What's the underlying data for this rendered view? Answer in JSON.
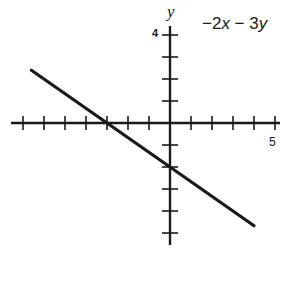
{
  "chart_data": {
    "type": "line",
    "title": "",
    "equation_label": "−2x − 3y",
    "xlabel": "",
    "ylabel": "y",
    "x_tick_label": "5",
    "y_tick_label": "4",
    "xlim": [
      -7,
      5
    ],
    "ylim": [
      -5,
      4
    ],
    "grid": false,
    "x_ticks": [
      -7,
      -6,
      -5,
      -4,
      -3,
      -2,
      -1,
      1,
      2,
      3,
      4,
      5
    ],
    "y_ticks": [
      -5,
      -4,
      -3,
      -2,
      -1,
      1,
      2,
      3,
      4
    ],
    "series": [
      {
        "name": "-2x - 3y = 6",
        "slope": -0.6667,
        "intercept": -2,
        "x": [
          -6.6,
          -3,
          0,
          4.0
        ],
        "y": [
          2.4,
          0,
          -2,
          -4.67
        ]
      }
    ],
    "colors": {
      "axis": "#1a1a1a",
      "line": "#1a1a1a",
      "background": "#ffffff"
    }
  },
  "labels": {
    "y_axis": "y",
    "equation_prefix": "−2",
    "equation_x": "x",
    "equation_mid": " − 3",
    "equation_y": "y",
    "tick_4": "4",
    "tick_5": "5"
  }
}
